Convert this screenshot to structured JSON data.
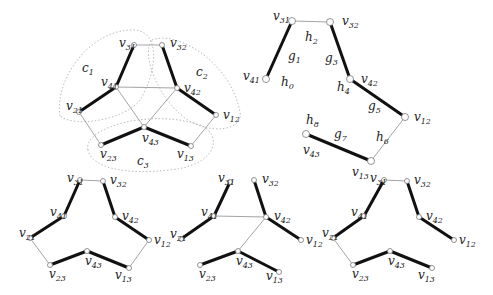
{
  "figure": {
    "width": 493,
    "height": 295,
    "colors": {
      "thick_edge": "#111111",
      "thin_edge": "#9a9a9a",
      "node_stroke": "#777777",
      "cluster": "#aaaaaa"
    },
    "panels": [
      {
        "id": "top-left-graph",
        "nodes": [
          {
            "id": "v31",
            "label": "v",
            "sub": "31",
            "x": 134,
            "y": 45,
            "lx": 119,
            "ly": 47
          },
          {
            "id": "v32",
            "label": "v",
            "sub": "32",
            "x": 162,
            "y": 45,
            "lx": 170,
            "ly": 47
          },
          {
            "id": "v41",
            "label": "v",
            "sub": "41",
            "x": 116,
            "y": 87,
            "lx": 101,
            "ly": 86
          },
          {
            "id": "v42",
            "label": "v",
            "sub": "42",
            "x": 177,
            "y": 88,
            "lx": 184,
            "ly": 92
          },
          {
            "id": "v21",
            "label": "v",
            "sub": "21",
            "x": 79,
            "y": 112,
            "lx": 66,
            "ly": 110
          },
          {
            "id": "v12",
            "label": "v",
            "sub": "12",
            "x": 216,
            "y": 115,
            "lx": 223,
            "ly": 119
          },
          {
            "id": "v43",
            "label": "v",
            "sub": "43",
            "x": 144,
            "y": 127,
            "lx": 142,
            "ly": 142
          },
          {
            "id": "v23",
            "label": "v",
            "sub": "23",
            "x": 101,
            "y": 145,
            "lx": 100,
            "ly": 158
          },
          {
            "id": "v13",
            "label": "v",
            "sub": "13",
            "x": 191,
            "y": 146,
            "lx": 177,
            "ly": 158
          }
        ],
        "thick_edges": [
          [
            "v31",
            "v41"
          ],
          [
            "v41",
            "v21"
          ],
          [
            "v32",
            "v42"
          ],
          [
            "v42",
            "v12"
          ],
          [
            "v23",
            "v43"
          ],
          [
            "v43",
            "v13"
          ]
        ],
        "thin_edges": [
          [
            "v31",
            "v32"
          ],
          [
            "v41",
            "v42"
          ],
          [
            "v41",
            "v43"
          ],
          [
            "v42",
            "v43"
          ],
          [
            "v21",
            "v23"
          ],
          [
            "v12",
            "v13"
          ]
        ],
        "clusters": [
          {
            "label": "c",
            "sub": "1",
            "lx": 82,
            "ly": 72,
            "path": "M 60 116 C 54 80, 90 28, 135 30 C 160 32, 158 70, 140 100 C 125 120, 75 128, 60 116 Z"
          },
          {
            "label": "c",
            "sub": "2",
            "lx": 196,
            "ly": 76,
            "path": "M 152 40 C 175 30, 230 60, 240 112 C 244 130, 210 136, 185 118 C 160 100, 140 55, 152 40 Z"
          },
          {
            "label": "c",
            "sub": "3",
            "lx": 137,
            "ly": 165,
            "path": "M 88 150 C 82 128, 150 108, 200 125 C 222 133, 220 165, 170 170 C 125 175, 92 168, 88 150 Z"
          }
        ]
      },
      {
        "id": "top-right-path",
        "nodes": [
          {
            "id": "v31",
            "label": "v",
            "sub": "31",
            "x": 292,
            "y": 21,
            "lx": 273,
            "ly": 20
          },
          {
            "id": "v32",
            "label": "v",
            "sub": "32",
            "x": 330,
            "y": 22,
            "lx": 342,
            "ly": 25
          },
          {
            "id": "v41",
            "label": "v",
            "sub": "41",
            "x": 266,
            "y": 79,
            "lx": 243,
            "ly": 80
          },
          {
            "id": "v42",
            "label": "v",
            "sub": "42",
            "x": 350,
            "y": 79,
            "lx": 361,
            "ly": 83
          },
          {
            "id": "v12",
            "label": "v",
            "sub": "12",
            "x": 405,
            "y": 117,
            "lx": 414,
            "ly": 121
          },
          {
            "id": "v43",
            "label": "v",
            "sub": "43",
            "x": 306,
            "y": 134,
            "lx": 303,
            "ly": 154
          },
          {
            "id": "v13",
            "label": "v",
            "sub": "13",
            "x": 371,
            "y": 161,
            "lx": 352,
            "ly": 176
          }
        ],
        "thick_edges": [
          [
            "v31",
            "v41"
          ],
          [
            "v32",
            "v42"
          ],
          [
            "v42",
            "v12"
          ],
          [
            "v43",
            "v13"
          ]
        ],
        "thin_edges": [
          [
            "v31",
            "v32"
          ],
          [
            "v12",
            "v13"
          ]
        ],
        "edge_labels": [
          {
            "label": "h",
            "sub": "2",
            "x": 305,
            "y": 41
          },
          {
            "label": "g",
            "sub": "1",
            "x": 288,
            "y": 60
          },
          {
            "label": "g",
            "sub": "3",
            "x": 325,
            "y": 62
          },
          {
            "label": "h",
            "sub": "0",
            "x": 281,
            "y": 86
          },
          {
            "label": "h",
            "sub": "4",
            "x": 337,
            "y": 91
          },
          {
            "label": "g",
            "sub": "5",
            "x": 368,
            "y": 110
          },
          {
            "label": "h",
            "sub": "8",
            "x": 306,
            "y": 124
          },
          {
            "label": "g",
            "sub": "7",
            "x": 334,
            "y": 138
          },
          {
            "label": "h",
            "sub": "6",
            "x": 376,
            "y": 141
          }
        ]
      },
      {
        "id": "bottom-left-graph",
        "nodes": [
          {
            "id": "v31",
            "label": "v",
            "sub": "31",
            "x": 80,
            "y": 180,
            "lx": 67,
            "ly": 182
          },
          {
            "id": "v32",
            "label": "v",
            "sub": "32",
            "x": 103,
            "y": 181,
            "lx": 110,
            "ly": 184
          },
          {
            "id": "v41",
            "label": "v",
            "sub": "41",
            "x": 64,
            "y": 216,
            "lx": 50,
            "ly": 216
          },
          {
            "id": "v42",
            "label": "v",
            "sub": "42",
            "x": 115,
            "y": 217,
            "lx": 122,
            "ly": 220
          },
          {
            "id": "v21",
            "label": "v",
            "sub": "21",
            "x": 30,
            "y": 238,
            "lx": 19,
            "ly": 237
          },
          {
            "id": "v12",
            "label": "v",
            "sub": "12",
            "x": 149,
            "y": 240,
            "lx": 154,
            "ly": 244
          },
          {
            "id": "v43",
            "label": "v",
            "sub": "43",
            "x": 87,
            "y": 251,
            "lx": 85,
            "ly": 265
          },
          {
            "id": "v23",
            "label": "v",
            "sub": "23",
            "x": 50,
            "y": 265,
            "lx": 49,
            "ly": 278
          },
          {
            "id": "v13",
            "label": "v",
            "sub": "13",
            "x": 129,
            "y": 268,
            "lx": 115,
            "ly": 279
          }
        ],
        "thick_edges": [
          [
            "v31",
            "v41"
          ],
          [
            "v41",
            "v21"
          ],
          [
            "v32",
            "v42"
          ],
          [
            "v42",
            "v12"
          ],
          [
            "v23",
            "v43"
          ],
          [
            "v43",
            "v13"
          ]
        ],
        "thin_edges": [
          [
            "v31",
            "v32"
          ],
          [
            "v21",
            "v23"
          ],
          [
            "v12",
            "v13"
          ]
        ]
      },
      {
        "id": "bottom-middle-graph",
        "nodes": [
          {
            "id": "v31",
            "label": "v",
            "sub": "31",
            "x": 230,
            "y": 182,
            "lx": 218,
            "ly": 182
          },
          {
            "id": "v32",
            "label": "v",
            "sub": "32",
            "x": 254,
            "y": 180,
            "lx": 262,
            "ly": 183
          },
          {
            "id": "v41",
            "label": "v",
            "sub": "41",
            "x": 214,
            "y": 216,
            "lx": 201,
            "ly": 216
          },
          {
            "id": "v42",
            "label": "v",
            "sub": "42",
            "x": 266,
            "y": 217,
            "lx": 274,
            "ly": 220
          },
          {
            "id": "v21",
            "label": "v",
            "sub": "21",
            "x": 181,
            "y": 239,
            "lx": 170,
            "ly": 238
          },
          {
            "id": "v12",
            "label": "v",
            "sub": "12",
            "x": 301,
            "y": 240,
            "lx": 306,
            "ly": 244
          },
          {
            "id": "v43",
            "label": "v",
            "sub": "43",
            "x": 238,
            "y": 251,
            "lx": 236,
            "ly": 265
          },
          {
            "id": "v23",
            "label": "v",
            "sub": "23",
            "x": 200,
            "y": 265,
            "lx": 199,
            "ly": 278
          },
          {
            "id": "v13",
            "label": "v",
            "sub": "13",
            "x": 279,
            "y": 272,
            "lx": 266,
            "ly": 280
          }
        ],
        "thick_edges": [
          [
            "v31",
            "v41"
          ],
          [
            "v41",
            "v21"
          ],
          [
            "v32",
            "v42"
          ],
          [
            "v42",
            "v12"
          ],
          [
            "v23",
            "v43"
          ],
          [
            "v43",
            "v13"
          ]
        ],
        "thin_edges": [
          [
            "v41",
            "v42"
          ],
          [
            "v42",
            "v43"
          ]
        ]
      },
      {
        "id": "bottom-right-graph",
        "nodes": [
          {
            "id": "v31",
            "label": "v",
            "sub": "31",
            "x": 384,
            "y": 180,
            "lx": 370,
            "ly": 182
          },
          {
            "id": "v32",
            "label": "v",
            "sub": "32",
            "x": 407,
            "y": 181,
            "lx": 414,
            "ly": 184
          },
          {
            "id": "v41",
            "label": "v",
            "sub": "41",
            "x": 364,
            "y": 216,
            "lx": 351,
            "ly": 216
          },
          {
            "id": "v42",
            "label": "v",
            "sub": "42",
            "x": 419,
            "y": 217,
            "lx": 426,
            "ly": 220
          },
          {
            "id": "v21",
            "label": "v",
            "sub": "21",
            "x": 333,
            "y": 238,
            "lx": 322,
            "ly": 237
          },
          {
            "id": "v12",
            "label": "v",
            "sub": "12",
            "x": 454,
            "y": 240,
            "lx": 459,
            "ly": 244
          },
          {
            "id": "v43",
            "label": "v",
            "sub": "43",
            "x": 390,
            "y": 251,
            "lx": 388,
            "ly": 265
          },
          {
            "id": "v23",
            "label": "v",
            "sub": "23",
            "x": 353,
            "y": 265,
            "lx": 352,
            "ly": 278
          },
          {
            "id": "v13",
            "label": "v",
            "sub": "13",
            "x": 432,
            "y": 268,
            "lx": 418,
            "ly": 279
          }
        ],
        "thick_edges": [
          [
            "v31",
            "v41"
          ],
          [
            "v41",
            "v21"
          ],
          [
            "v32",
            "v42"
          ],
          [
            "v42",
            "v12"
          ],
          [
            "v23",
            "v43"
          ],
          [
            "v43",
            "v13"
          ]
        ],
        "thin_edges": [
          [
            "v31",
            "v32"
          ],
          [
            "v21",
            "v23"
          ]
        ]
      }
    ],
    "extra_labels": [
      {
        "label": "v",
        "sub": "12",
        "x": 321,
        "y": 237,
        "note": "partial label left of bottom-right graph"
      },
      {
        "label": "v",
        "sub": "12",
        "x": 152,
        "y": 237,
        "note": "partial label overlapping"
      }
    ]
  }
}
